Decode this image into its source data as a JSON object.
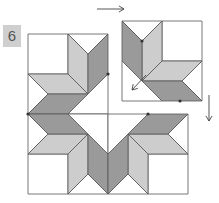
{
  "step": {
    "label": "6"
  },
  "colors": {
    "white": "#ffffff",
    "light": "#cdcdcd",
    "dark": "#9a9a9a",
    "stroke": "#555555",
    "badge": "#cfcfcf"
  },
  "block": {
    "center": [
      108,
      114
    ],
    "half": 40,
    "detached_quadrant": "top-right",
    "detached_offset": [
      14,
      -13
    ]
  },
  "arrows": [
    {
      "name": "move-right-arrow",
      "from": [
        97,
        9
      ],
      "to": [
        124,
        9
      ]
    },
    {
      "name": "move-down-arrow",
      "from": [
        209,
        95
      ],
      "to": [
        209,
        121
      ]
    },
    {
      "name": "move-diagonal-arrow",
      "from": [
        146,
        75
      ],
      "to": [
        132,
        90
      ]
    }
  ]
}
